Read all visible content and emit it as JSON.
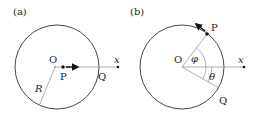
{
  "panels": [
    {
      "id": "a",
      "label": "(a)",
      "center_label": "O",
      "point_label": "P",
      "intersection_label": "Q",
      "axis_label": "x",
      "radius_label": "R"
    },
    {
      "id": "b",
      "label": "(b)",
      "center_label": "O",
      "point_label": "P",
      "intersection_label": "Q",
      "axis_label": "x",
      "angle_phi_label": "φ",
      "angle_theta_label": "θ"
    }
  ],
  "colors": {
    "circle": "#333333",
    "guide_line": "#999999",
    "arrow": "#111111"
  }
}
